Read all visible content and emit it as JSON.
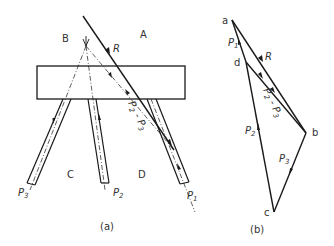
{
  "colors": {
    "ink": "#1a1a1a",
    "text": "#333333",
    "background": "#ffffff"
  },
  "figure_a": {
    "caption": "(a)",
    "regions": {
      "A": "A",
      "B": "B",
      "C": "C",
      "D": "D"
    },
    "force_labels": {
      "R": "R",
      "P1": "P",
      "P1_sub": "1",
      "P2": "P",
      "P2_sub": "2",
      "P3": "P",
      "P3_sub": "3",
      "P23": "P",
      "P23_sub1": "2",
      "P23_dash": " - ",
      "P23_p": "P",
      "P23_sub2": "3"
    }
  },
  "figure_b": {
    "caption": "(b)",
    "points": {
      "a": "a",
      "b": "b",
      "c": "c",
      "d": "d"
    },
    "force_labels": {
      "R": "R",
      "P1": "P",
      "P1_sub": "1",
      "P2": "P",
      "P2_sub": "2",
      "P3": "P",
      "P3_sub": "3",
      "P23": "P",
      "P23_sub1": "2",
      "P23_dash": " - ",
      "P23_p": "P",
      "P23_sub2": "3"
    }
  }
}
